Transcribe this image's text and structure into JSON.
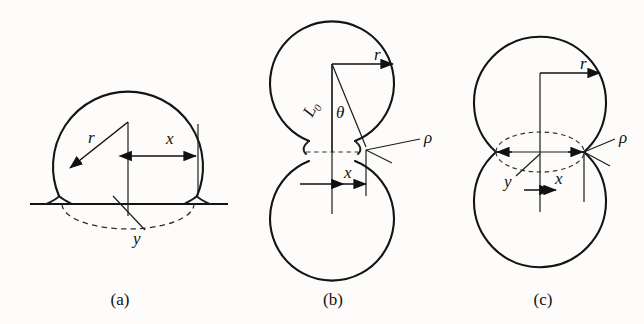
{
  "figure": {
    "type": "scientific-diagram",
    "background_color": "#fdfcfb",
    "ink_color": "#141414",
    "panel_count": 3
  },
  "panels": [
    {
      "id": "a",
      "caption": "(a)",
      "caption_x": 120,
      "caption_y": 305,
      "configuration": "sphere-on-flat-substrate",
      "sphere": {
        "cx": 128,
        "cy": 122,
        "r": 75
      },
      "substrate": {
        "y": 204,
        "x1": 30,
        "x2": 228
      },
      "dashed_arc": {
        "cx": 128,
        "cy": 204,
        "rx": 66,
        "ry": 25
      },
      "labels": [
        {
          "name": "r",
          "text": "r",
          "x": 88,
          "y": 143,
          "italic": true
        },
        {
          "name": "x",
          "text": "x",
          "x": 166,
          "y": 144,
          "italic": true
        },
        {
          "name": "y",
          "text": "y",
          "x": 133,
          "y": 240,
          "italic": true
        }
      ]
    },
    {
      "id": "b",
      "caption": "(b)",
      "caption_x": 333,
      "caption_y": 305,
      "configuration": "two-spheres-with-concave-neck",
      "upper_sphere": {
        "cx": 332,
        "cy": 84,
        "r": 62
      },
      "lower_sphere": {
        "cx": 332,
        "cy": 212,
        "r": 62
      },
      "neck": {
        "y": 150,
        "half_width": 26
      },
      "labels": [
        {
          "name": "r",
          "text": "r",
          "x": 374,
          "y": 64,
          "italic": true
        },
        {
          "name": "L0",
          "text": "L",
          "sub": "0",
          "x": 312,
          "y": 112,
          "italic": true,
          "rotated": true
        },
        {
          "name": "theta",
          "text": "θ",
          "x": 336,
          "y": 116,
          "italic": true
        },
        {
          "name": "rho",
          "text": "ρ",
          "x": 424,
          "y": 143,
          "italic": true
        },
        {
          "name": "x",
          "text": "x",
          "x": 344,
          "y": 178,
          "italic": true
        }
      ]
    },
    {
      "id": "c",
      "caption": "(c)",
      "caption_x": 543,
      "caption_y": 305,
      "configuration": "two-overlapping-spheres-lens-contact",
      "upper_sphere": {
        "cx": 540,
        "cy": 94,
        "r": 66
      },
      "lower_sphere": {
        "cx": 540,
        "cy": 216,
        "r": 66
      },
      "contact": {
        "y": 152,
        "half_width": 44
      },
      "dashed_lens": {
        "cx": 540,
        "cy": 152,
        "rx": 44,
        "ry": 20
      },
      "labels": [
        {
          "name": "r",
          "text": "r",
          "x": 580,
          "y": 73,
          "italic": true
        },
        {
          "name": "rho",
          "text": "ρ",
          "x": 619,
          "y": 143,
          "italic": true
        },
        {
          "name": "y",
          "text": "y",
          "x": 506,
          "y": 183,
          "italic": true
        },
        {
          "name": "x",
          "text": "x",
          "x": 559,
          "y": 178,
          "italic": true
        }
      ]
    }
  ],
  "symbols": {
    "r": "sphere radius",
    "x": "neck / contact half-width",
    "y": "meniscus vertical coordinate",
    "rho": "meniscus radius of curvature",
    "L0": "center-to-neck distance",
    "theta": "half-angle at sphere center"
  }
}
